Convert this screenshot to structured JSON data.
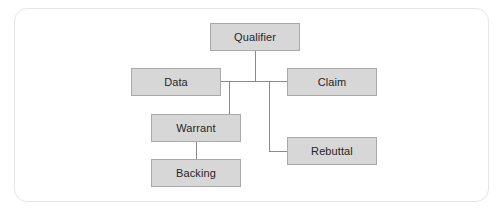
{
  "diagram": {
    "type": "Toulmin argument model",
    "nodes": [
      {
        "id": "qualifier",
        "label": "Qualifier"
      },
      {
        "id": "data",
        "label": "Data"
      },
      {
        "id": "claim",
        "label": "Claim"
      },
      {
        "id": "warrant",
        "label": "Warrant"
      },
      {
        "id": "rebuttal",
        "label": "Rebuttal"
      },
      {
        "id": "backing",
        "label": "Backing"
      }
    ],
    "edges": [
      {
        "from": "data",
        "to": "claim"
      },
      {
        "from": "qualifier",
        "to": "data-claim-link"
      },
      {
        "from": "warrant",
        "to": "data-claim-link"
      },
      {
        "from": "rebuttal",
        "to": "data-claim-link"
      },
      {
        "from": "backing",
        "to": "warrant"
      }
    ],
    "colors": {
      "node_fill": "#d7d7d7",
      "node_border": "#a9a9a9",
      "line": "#8a8a8a",
      "card_border": "#e6e6e6"
    }
  }
}
